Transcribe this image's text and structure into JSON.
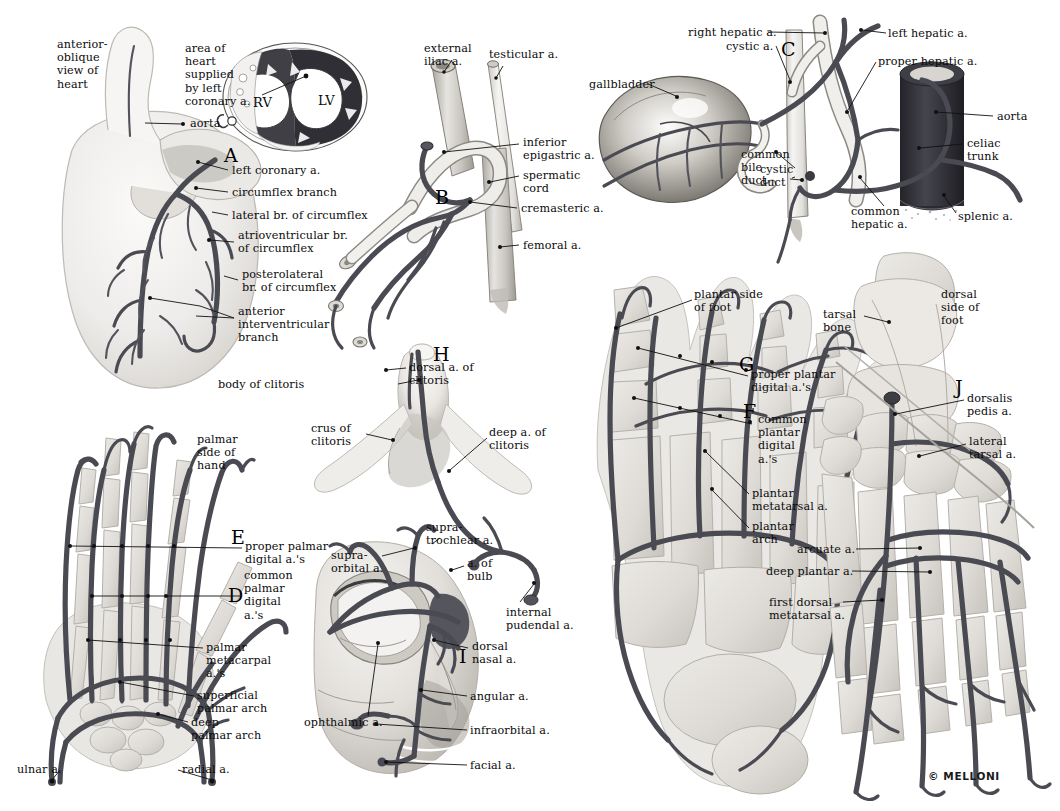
{
  "plate": {
    "copyright": "© MELLONI",
    "background": "#ffffff",
    "ink": "#111111",
    "artery_color": "#4a4a52"
  },
  "panels": [
    {
      "key": "A",
      "letter": "A",
      "name": "heart-coronary-arteries",
      "labels": [
        {
          "text": "anterior-\noblique\nview of\nheart",
          "x": 57,
          "y": 38,
          "align": "left"
        },
        {
          "text": "area of\nheart\nsupplied\nby left\ncoronary a.",
          "x": 185,
          "y": 42,
          "align": "left"
        },
        {
          "text": "aorta",
          "x": 148,
          "y": 121,
          "align": "left"
        },
        {
          "text": "RV",
          "x": 253,
          "y": 96,
          "align": "left"
        },
        {
          "text": "LV",
          "x": 318,
          "y": 94,
          "align": "left"
        },
        {
          "text": "left coronary a.",
          "x": 230,
          "y": 166,
          "align": "left"
        },
        {
          "text": "circumflex branch",
          "x": 230,
          "y": 190,
          "align": "left"
        },
        {
          "text": "lateral br. of circumflex",
          "x": 230,
          "y": 213,
          "align": "left"
        },
        {
          "text": "atrioventricular br.\nof circumflex",
          "x": 236,
          "y": 233,
          "align": "left"
        },
        {
          "text": "posterolateral\nbr. of circumflex",
          "x": 240,
          "y": 272,
          "align": "left"
        },
        {
          "text": "anterior\ninterventricular\nbranch",
          "x": 236,
          "y": 309,
          "align": "left"
        }
      ]
    },
    {
      "key": "B",
      "letter": "B",
      "name": "inguinal-femoral-arteries",
      "labels": [
        {
          "text": "external\niliac a.",
          "x": 424,
          "y": 44,
          "align": "left"
        },
        {
          "text": "testicular a.",
          "x": 489,
          "y": 50,
          "align": "left"
        },
        {
          "text": "inferior\nepigastric a.",
          "x": 521,
          "y": 138,
          "align": "left"
        },
        {
          "text": "spermatic\ncord",
          "x": 521,
          "y": 172,
          "align": "left"
        },
        {
          "text": "cremasteric a.",
          "x": 519,
          "y": 205,
          "align": "left"
        },
        {
          "text": "femoral a.",
          "x": 521,
          "y": 241,
          "align": "left"
        }
      ]
    },
    {
      "key": "C",
      "letter": "C",
      "name": "hepatic-biliary-arteries",
      "labels": [
        {
          "text": "right hepatic a.",
          "x": 688,
          "y": 28,
          "align": "left"
        },
        {
          "text": "cystic a.",
          "x": 740,
          "y": 42,
          "align": "left"
        },
        {
          "text": "left hepatic a.",
          "x": 888,
          "y": 29,
          "align": "left"
        },
        {
          "text": "proper hepatic a.",
          "x": 878,
          "y": 55,
          "align": "left"
        },
        {
          "text": "gallbladder",
          "x": 589,
          "y": 80,
          "align": "left"
        },
        {
          "text": "aorta",
          "x": 995,
          "y": 112,
          "align": "left"
        },
        {
          "text": "cystic\nduct",
          "x": 758,
          "y": 165,
          "align": "left"
        },
        {
          "text": "celiac\ntrunk",
          "x": 965,
          "y": 139,
          "align": "left"
        },
        {
          "text": "common\nbile\nduct",
          "x": 741,
          "y": 150,
          "align": "left"
        },
        {
          "text": "common\nhepatic a.",
          "x": 851,
          "y": 207,
          "align": "left"
        },
        {
          "text": "splenic a.",
          "x": 958,
          "y": 212,
          "align": "left"
        }
      ]
    },
    {
      "key": "DE",
      "letters": [
        "D",
        "E"
      ],
      "name": "hand-palmar-arteries",
      "labels": [
        {
          "text": "palmar\nside of\nhand",
          "x": 197,
          "y": 435,
          "align": "left"
        },
        {
          "text": "proper palmar\ndigital a.'s",
          "x": 243,
          "y": 542,
          "align": "left"
        },
        {
          "text": "common\npalmar\ndigital\na.'s",
          "x": 241,
          "y": 562,
          "align": "left"
        },
        {
          "text": "palmar\nmetacarpal\na.'s",
          "x": 205,
          "y": 643,
          "align": "left"
        },
        {
          "text": "superficial\npalmar arch",
          "x": 196,
          "y": 692,
          "align": "left"
        },
        {
          "text": "deep\npalmar arch",
          "x": 190,
          "y": 719,
          "align": "left"
        },
        {
          "text": "ulnar a.",
          "x": 17,
          "y": 767,
          "align": "left"
        },
        {
          "text": "radial a.",
          "x": 181,
          "y": 767,
          "align": "left"
        }
      ]
    },
    {
      "key": "H",
      "letter": "H",
      "name": "clitoris-arteries",
      "labels": [
        {
          "text": "dorsal a. of\nclitoris",
          "x": 408,
          "y": 363,
          "align": "left"
        },
        {
          "text": "body of clitoris",
          "x": 317,
          "y": 380,
          "align": "left"
        },
        {
          "text": "crus of\nclitoris",
          "x": 313,
          "y": 425,
          "align": "left"
        },
        {
          "text": "deep a. of\nclitoris",
          "x": 489,
          "y": 428,
          "align": "left"
        }
      ]
    },
    {
      "key": "I",
      "letter": "I",
      "name": "facial-orbital-arteries",
      "labels": [
        {
          "text": "supra-\ntrochlear a.",
          "x": 425,
          "y": 523,
          "align": "left"
        },
        {
          "text": "supra-\norbital a.",
          "x": 331,
          "y": 551,
          "align": "left"
        },
        {
          "text": "a. of\nbulb",
          "x": 466,
          "y": 559,
          "align": "left"
        },
        {
          "text": "internal\npudendal a.",
          "x": 505,
          "y": 608,
          "align": "left"
        },
        {
          "text": "dorsal\nnasal a.",
          "x": 471,
          "y": 642,
          "align": "left"
        },
        {
          "text": "angular a.",
          "x": 469,
          "y": 692,
          "align": "left"
        },
        {
          "text": "ophthalmic a.",
          "x": 310,
          "y": 718,
          "align": "left"
        },
        {
          "text": "infraorbital a.",
          "x": 469,
          "y": 726,
          "align": "left"
        },
        {
          "text": "facial a.",
          "x": 469,
          "y": 761,
          "align": "left"
        }
      ]
    },
    {
      "key": "FG",
      "letters": [
        "F",
        "G"
      ],
      "name": "foot-plantar-arteries",
      "labels": [
        {
          "text": "plantar side\nof foot",
          "x": 694,
          "y": 290,
          "align": "left"
        },
        {
          "text": "proper plantar\ndigital a.'s",
          "x": 751,
          "y": 370,
          "align": "left"
        },
        {
          "text": "common\nplantar\ndigital\na.'s",
          "x": 757,
          "y": 417,
          "align": "left"
        },
        {
          "text": "plantar\nmetatarsal a.",
          "x": 751,
          "y": 489,
          "align": "left"
        },
        {
          "text": "plantar\narch",
          "x": 751,
          "y": 522,
          "align": "left"
        }
      ]
    },
    {
      "key": "J",
      "letter": "J",
      "name": "foot-dorsal-arteries",
      "labels": [
        {
          "text": "dorsal\nside of\nfoot",
          "x": 940,
          "y": 290,
          "align": "left"
        },
        {
          "text": "tarsal\nbone",
          "x": 822,
          "y": 310,
          "align": "left"
        },
        {
          "text": "dorsalis\npedis a.",
          "x": 966,
          "y": 394,
          "align": "left"
        },
        {
          "text": "lateral\ntarsal a.",
          "x": 968,
          "y": 437,
          "align": "left"
        },
        {
          "text": "arcuate a.",
          "x": 797,
          "y": 545,
          "align": "left"
        },
        {
          "text": "deep plantar a.",
          "x": 765,
          "y": 567,
          "align": "left"
        },
        {
          "text": "first dorsal\nmetatarsal a.",
          "x": 768,
          "y": 598,
          "align": "left"
        }
      ]
    }
  ]
}
